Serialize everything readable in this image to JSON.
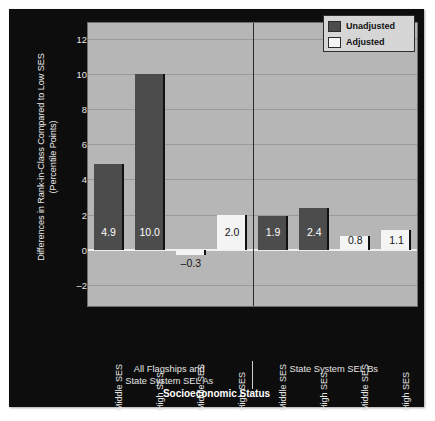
{
  "chart_data": {
    "type": "bar",
    "title": "",
    "xlabel": "Socioeconomic Status",
    "ylabel": "Differences in Rank-in-Class Compared to Low SES (Percentile Points)",
    "ylabel_line1": "Differences in Rank-in-Class Compared to Low SES",
    "ylabel_line2": "(Percentile Points)",
    "ylim": [
      -3.2,
      12.9
    ],
    "yticks": [
      12,
      10,
      8,
      6,
      4,
      2,
      0,
      -2
    ],
    "ytick_labels": [
      "12",
      "10",
      "8",
      "6",
      "4",
      "2",
      "0",
      "–2"
    ],
    "grid": true,
    "legend_position": "top-right",
    "legend": [
      {
        "name": "Unadjusted",
        "color": "#4c4c4c"
      },
      {
        "name": "Adjusted",
        "color": "#f4f4f4"
      }
    ],
    "categories": [
      "Middle SES",
      "High SES",
      "Middle SES",
      "High SES",
      "Middle SES",
      "High SES",
      "Middle SES",
      "High SES"
    ],
    "groups": [
      {
        "label": "All Flagships and\nState System SEL As",
        "line1": "All Flagships and",
        "line2": "State System SEL As",
        "bar_indices": [
          0,
          1,
          2,
          3
        ]
      },
      {
        "label": "State System SEL Bs",
        "line1": "State System SEL Bs",
        "line2": "",
        "bar_indices": [
          4,
          5,
          6,
          7
        ]
      }
    ],
    "bars": [
      {
        "category": "Middle SES",
        "series": "Unadjusted",
        "value": 4.9,
        "label": "4.9"
      },
      {
        "category": "High SES",
        "series": "Unadjusted",
        "value": 10.0,
        "label": "10.0"
      },
      {
        "category": "Middle SES",
        "series": "Adjusted",
        "value": -0.3,
        "label": "–0.3"
      },
      {
        "category": "High SES",
        "series": "Adjusted",
        "value": 2.0,
        "label": "2.0"
      },
      {
        "category": "Middle SES",
        "series": "Unadjusted",
        "value": 1.9,
        "label": "1.9"
      },
      {
        "category": "High SES",
        "series": "Unadjusted",
        "value": 2.4,
        "label": "2.4"
      },
      {
        "category": "Middle SES",
        "series": "Adjusted",
        "value": 0.8,
        "label": "0.8"
      },
      {
        "category": "High SES",
        "series": "Adjusted",
        "value": 1.1,
        "label": "1.1"
      }
    ],
    "series": [
      {
        "name": "Unadjusted",
        "values": [
          4.9,
          10.0,
          null,
          null,
          1.9,
          2.4,
          null,
          null
        ]
      },
      {
        "name": "Adjusted",
        "values": [
          null,
          null,
          -0.3,
          2.0,
          null,
          null,
          0.8,
          1.1
        ]
      }
    ],
    "colors": {
      "unadjusted": "#4c4c4c",
      "adjusted": "#f4f4f4",
      "plot_background": "#b6b6b6",
      "figure_background": "#0d0d0d",
      "gridline": "#9a9a9a",
      "text": "#e8e8e8"
    }
  }
}
